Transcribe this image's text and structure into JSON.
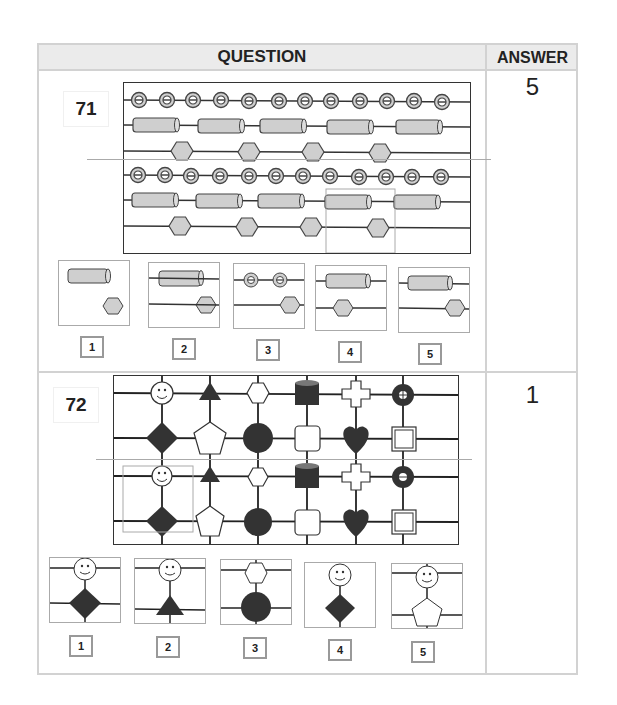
{
  "header": {
    "question_label": "QUESTION",
    "answer_label": "ANSWER"
  },
  "questions": [
    {
      "number": "71",
      "answer": "5",
      "pattern": "rows of beads: rings, cylinders, hexagons repeated in two bands; highlighted window to match",
      "options": [
        {
          "label": "1",
          "content": "cylinder over hexagon, no wires"
        },
        {
          "label": "2",
          "content": "cylinder and hexagon threaded on wires (centered)"
        },
        {
          "label": "3",
          "content": "two rings over hexagon"
        },
        {
          "label": "4",
          "content": "cylinder over hexagon left-shifted"
        },
        {
          "label": "5",
          "content": "cylinder over hexagon right-shifted"
        }
      ]
    },
    {
      "number": "72",
      "answer": "1",
      "pattern": "grid of shapes: smiley, triangle, hexagon, cylinder, cross, ring / diamond, pentagon, circle, rounded square, heart, window",
      "options": [
        {
          "label": "1",
          "content": "smiley over diamond with wires"
        },
        {
          "label": "2",
          "content": "smiley over triangle"
        },
        {
          "label": "3",
          "content": "hexagon over circle"
        },
        {
          "label": "4",
          "content": "smiley over diamond, no horizontal wires"
        },
        {
          "label": "5",
          "content": "smiley over pentagon"
        }
      ]
    }
  ],
  "colors": {
    "border": "#d2d2d2",
    "header_bg": "#ebebeb",
    "bead_fill": "#cfcfcf",
    "dark_fill": "#333333"
  }
}
